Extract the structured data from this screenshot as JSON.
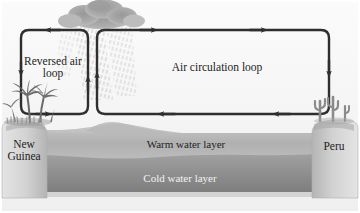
{
  "figure": {
    "width": 360,
    "height": 213,
    "background_color": "#ffffff",
    "panel_color": "#f2f2f2"
  },
  "labels": {
    "reversed_loop": "Reversed air\nloop",
    "air_circulation_loop": "Air circulation loop",
    "new_guinea": "New\nGuinea",
    "peru": "Peru",
    "warm_water_layer": "Warm water layer",
    "cold_water_layer": "Cold water layer"
  },
  "elements": {
    "cloud": "rain-cloud",
    "rain": "rain-hatching",
    "palm_trees": "palm-tree-cluster",
    "cacti": "cactus-cluster",
    "left_landmass": "new-guinea-landmass",
    "right_landmass": "peru-landmass",
    "ocean_basin": "ocean-basin"
  },
  "loops": [
    {
      "name": "reversed-air-loop",
      "direction": "counterclockwise",
      "arrows": [
        "left-top",
        "down-left",
        "right-bottom",
        "up-right"
      ]
    },
    {
      "name": "air-circulation-loop",
      "direction": "clockwise",
      "arrows": [
        "right-top",
        "down-right",
        "left-bottom",
        "up-left"
      ]
    }
  ],
  "colors": {
    "arrow": "#2e2e2e",
    "cloud": "#a9a9a9",
    "warm_water": "#b5b5b5",
    "cold_water": "#8e8e8e",
    "land": "#cfcfcf",
    "text_dark": "#1c1c1c",
    "text_light": "#f2f2f2"
  }
}
